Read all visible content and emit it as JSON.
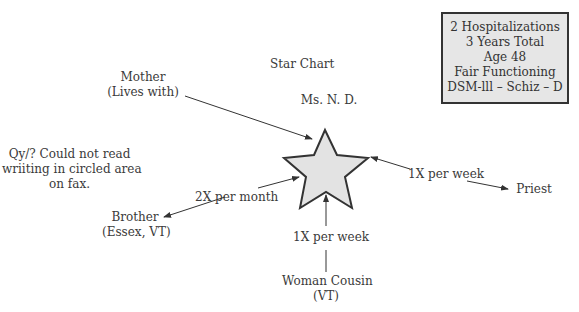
{
  "title": "Star Chart",
  "subject": "Ms. N. D.",
  "info_box": [
    "2 Hospitalizations",
    "3 Years Total",
    "Age 48",
    "Fair Functioning",
    "DSM-lll – Schiz – D"
  ],
  "note": [
    "Qy/? Could not read",
    "wriiting in circled area",
    "on fax."
  ],
  "nodes": {
    "mother": [
      "Mother",
      "(Lives with)"
    ],
    "brother": [
      "Brother",
      "(Essex, VT)"
    ],
    "cousin": [
      "Woman Cousin",
      "(VT)"
    ],
    "priest": [
      "Priest"
    ]
  },
  "edges": {
    "brother": "2X per month",
    "cousin": "1X per week",
    "priest": "1X per week"
  },
  "colors": {
    "star_fill": "#e3e3e3",
    "stroke": "#333333",
    "box_fill": "#e6e6e6"
  }
}
